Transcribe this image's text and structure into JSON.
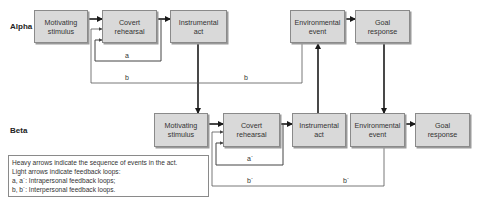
{
  "rows": {
    "alpha": {
      "label": "Alpha",
      "boxes": [
        {
          "id": "motivating",
          "label": "Motivating\nstimulus"
        },
        {
          "id": "covert",
          "label": "Covert\nrehearsal"
        },
        {
          "id": "instrumental",
          "label": "Instrumental\nact"
        },
        {
          "id": "environmental",
          "label": "Environmental\nevent"
        },
        {
          "id": "goal",
          "label": "Goal\nresponse"
        }
      ]
    },
    "beta": {
      "label": "Beta",
      "boxes": [
        {
          "id": "motivating",
          "label": "Motivating\nstimulus"
        },
        {
          "id": "covert",
          "label": "Covert\nrehearsal"
        },
        {
          "id": "instrumental",
          "label": "Instrumental\nact"
        },
        {
          "id": "environmental",
          "label": "Environmental\nevent"
        },
        {
          "id": "goal",
          "label": "Goal\nresponse"
        }
      ]
    }
  },
  "loops": {
    "a": "a",
    "b_left": "b",
    "b_right": "b",
    "a_prime": "a´",
    "b_prime_left": "b´",
    "b_prime_right": "b´"
  },
  "legend": {
    "line1": "Heavy arrows indicate the sequence of events in the act.",
    "line2": "Light arrows indicate feedback loops:",
    "line3": "a, a´: Intrapersonal feedback loops;",
    "line4": "b, b´: Interpersonal feedback loops."
  },
  "colors": {
    "box_fill": "#d9d9d9",
    "box_border": "#8a8a8a",
    "heavy_arrow": "#1a1a1a",
    "light_arrow": "#555555"
  }
}
